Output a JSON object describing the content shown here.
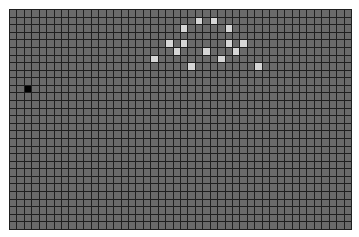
{
  "board": {
    "cols": 46,
    "rows": 29,
    "colors": {
      "empty": "#6a6a6a",
      "alive": "#d6d6d6",
      "cursor": "#000000",
      "grid_line": "#1f1f1f"
    },
    "cursor_cell": {
      "col": 2,
      "row": 10
    },
    "alive_cells": [
      {
        "col": 25,
        "row": 1
      },
      {
        "col": 27,
        "row": 1
      },
      {
        "col": 23,
        "row": 2
      },
      {
        "col": 29,
        "row": 2
      },
      {
        "col": 21,
        "row": 4
      },
      {
        "col": 23,
        "row": 4
      },
      {
        "col": 29,
        "row": 4
      },
      {
        "col": 31,
        "row": 4
      },
      {
        "col": 22,
        "row": 5
      },
      {
        "col": 26,
        "row": 5
      },
      {
        "col": 30,
        "row": 5
      },
      {
        "col": 19,
        "row": 6
      },
      {
        "col": 28,
        "row": 6
      },
      {
        "col": 24,
        "row": 7
      },
      {
        "col": 33,
        "row": 7
      }
    ]
  }
}
